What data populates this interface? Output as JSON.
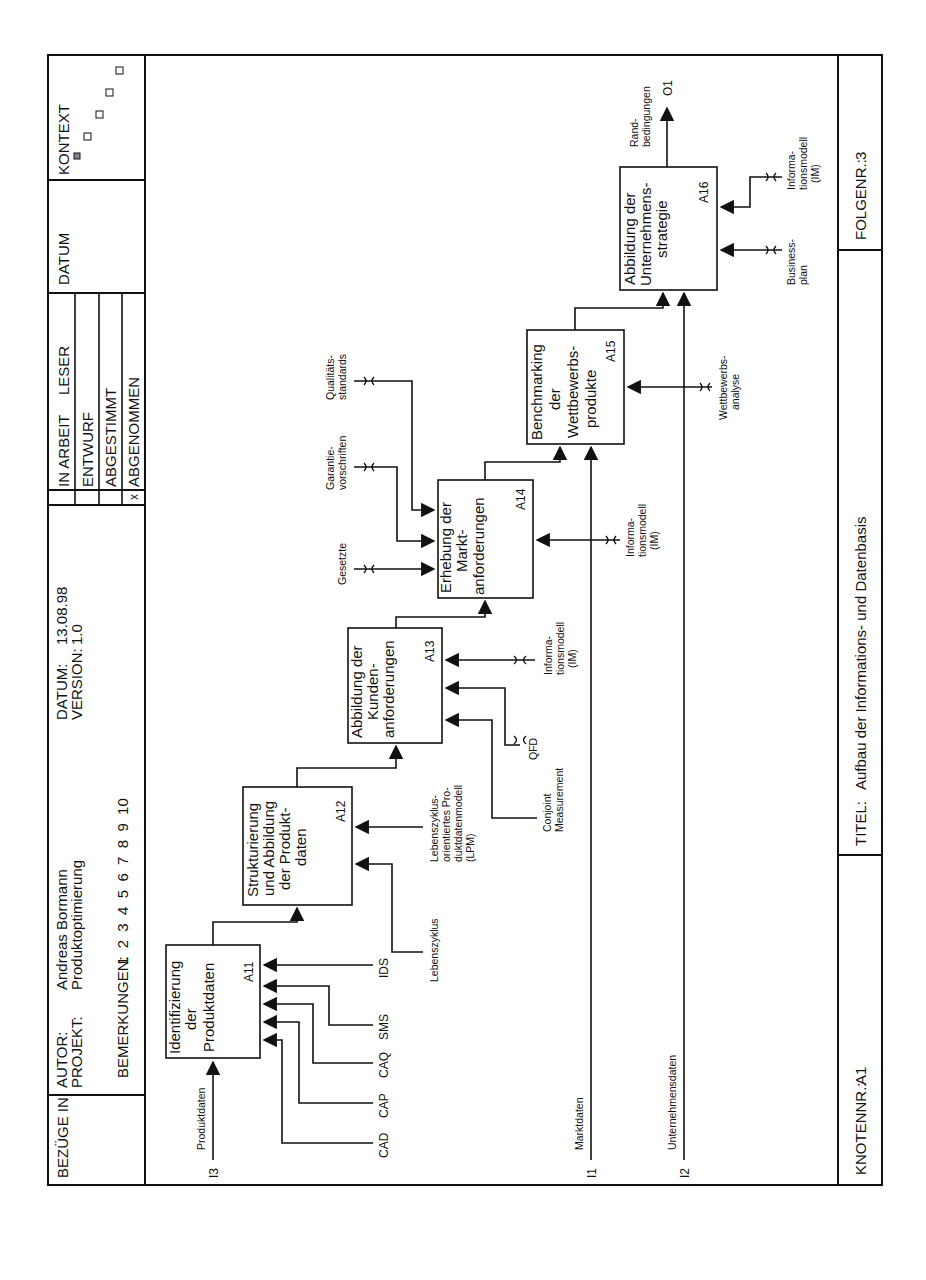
{
  "header": {
    "bezuege_in_label": "BEZÜGE IN:",
    "autor_label": "AUTOR:",
    "autor_value": "Andreas Bormann",
    "projekt_label": "PROJEKT:",
    "projekt_value": "Produktoptimierung",
    "bemerkungen_label": "BEMERKUNGEN:",
    "bemerkungen_numbers": "1  2  3  4  5  6  7  8  9  10",
    "datum_label": "DATUM:",
    "datum_value": "13.08.98",
    "version_label": "VERSION:",
    "version_value": "1.0",
    "status": [
      {
        "label": "IN ARBEIT",
        "mark": ""
      },
      {
        "label": "ENTWURF",
        "mark": ""
      },
      {
        "label": "ABGESTIMMT",
        "mark": ""
      },
      {
        "label": "ABGENOMMEN",
        "mark": "x"
      }
    ],
    "leser_label": "LESER",
    "datum_col_label": "DATUM",
    "kontext_label": "KONTEXT"
  },
  "footer": {
    "knotennr_label": "KNOTENNR.:",
    "knotennr_value": "A1",
    "titel_label": "TITEL:",
    "titel_value": "Aufbau der Informations- und Datenbasis",
    "folgenr_label": "FOLGENR.:",
    "folgenr_value": "3"
  },
  "diagram": {
    "boxes": [
      {
        "id": "A11",
        "lines": [
          "Identifizierung",
          "der",
          "Produktdaten"
        ]
      },
      {
        "id": "A12",
        "lines": [
          "Strukturierung",
          "und Abbildung",
          "der Produkt-",
          "daten"
        ]
      },
      {
        "id": "A13",
        "lines": [
          "Abbildung der",
          "Kunden-",
          "anforderungen"
        ]
      },
      {
        "id": "A14",
        "lines": [
          "Erhebung der",
          "Markt-",
          "anforderungen"
        ]
      },
      {
        "id": "A15",
        "lines": [
          "Benchmarking",
          "der",
          "Wettbewerbs-",
          "produkte"
        ]
      },
      {
        "id": "A16",
        "lines": [
          "Abbildung der",
          "Unternehmens-",
          "strategie"
        ]
      }
    ],
    "inputs": [
      {
        "code": "I3",
        "label": "Produktdaten"
      },
      {
        "code": "I1",
        "label": "Marktdaten"
      },
      {
        "code": "I2",
        "label": "Unternehmensdaten"
      }
    ],
    "output": {
      "code": "O1",
      "label_lines": [
        "Rand-",
        "bedingungen"
      ]
    },
    "mechanisms": {
      "a11": [
        "CAD",
        "CAP",
        "CAQ",
        "SMS",
        "IDS"
      ],
      "a12_lebenszyklus": "Lebenszyklus",
      "a12_lpm": [
        "Lebenszyklus-",
        "orientiertes Pro-",
        "duktdatenmodell",
        "(LPM)"
      ],
      "a13_conjoint": [
        "Conjoint",
        "Measurement"
      ],
      "a13_qfd": "QFD",
      "a13_im": [
        "Informa-",
        "tionsmodell",
        "(IM)"
      ],
      "a14_gesetzte": "Gesetzte",
      "a14_garantie": [
        "Garantie-",
        "vorschriften"
      ],
      "a14_qualitaet": [
        "Qualitäts-",
        "standards"
      ],
      "a14_im": [
        "Informa-",
        "tionsmodell",
        "(IM)"
      ],
      "a15_wettbewerb": [
        "Wettbewerbs-",
        "analyse"
      ],
      "a16_business": [
        "Business-",
        "plan"
      ],
      "a16_im": [
        "Informa-",
        "tionsmodell",
        "(IM)"
      ]
    }
  }
}
